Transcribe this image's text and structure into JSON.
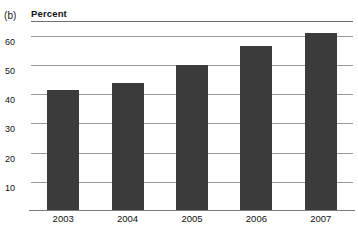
{
  "figure": {
    "panel_label": "(b)",
    "axis_title": "Percent"
  },
  "colors": {
    "bar_fill": "#3b3b3b",
    "gridline": "#9a9a9a",
    "top_rule": "#6f6f6f",
    "baseline": "#7a7a7a",
    "background": "#ffffff",
    "text": "#111111"
  },
  "chart_data": {
    "type": "bar",
    "title": "",
    "subtitle": "",
    "panel": "(b)",
    "xlabel": "",
    "ylabel": "Percent",
    "categories": [
      "2003",
      "2004",
      "2005",
      "2006",
      "2007"
    ],
    "values": [
      41,
      43.5,
      49.5,
      56,
      60.5
    ],
    "series": [
      {
        "name": "Percent",
        "values": [
          41,
          43.5,
          49.5,
          56,
          60.5
        ]
      }
    ],
    "ylim": [
      0,
      65
    ],
    "yticks": [
      10,
      20,
      30,
      40,
      50,
      60
    ],
    "ytick_labels": [
      "10",
      "20",
      "30",
      "40",
      "50",
      "60"
    ],
    "xtick_labels": [
      "2003",
      "2004",
      "2005",
      "2006",
      "2007"
    ],
    "grid": true,
    "grid_axis": "y",
    "legend": false,
    "legend_position": "none",
    "annotations": [],
    "bar_color": "#3b3b3b"
  }
}
